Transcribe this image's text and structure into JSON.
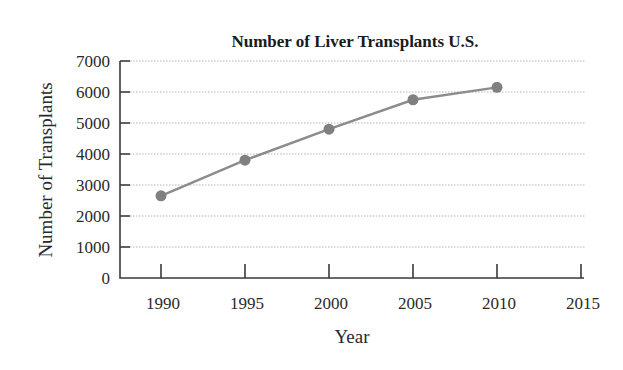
{
  "chart_data": {
    "type": "line",
    "title": "Number of Liver Transplants U.S.",
    "xlabel": "Year",
    "ylabel": "Number of Transplants",
    "x": [
      1990,
      1995,
      2000,
      2005,
      2010
    ],
    "series": [
      {
        "name": "Liver Transplants",
        "values": [
          2650,
          3800,
          4800,
          5750,
          6150
        ]
      }
    ],
    "x_ticks": [
      "1990",
      "1995",
      "2000",
      "2005",
      "2010",
      "2015"
    ],
    "y_ticks": [
      "0",
      "1000",
      "2000",
      "3000",
      "4000",
      "5000",
      "6000",
      "7000"
    ],
    "xlim": [
      1987.5,
      2015
    ],
    "ylim": [
      0,
      7000
    ],
    "grid": "horizontal dotted",
    "legend": null,
    "colors": {
      "line": "#8c8c8c",
      "marker": "#808080",
      "axis": "#3a3a3a",
      "grid": "#b5b5b5"
    }
  }
}
